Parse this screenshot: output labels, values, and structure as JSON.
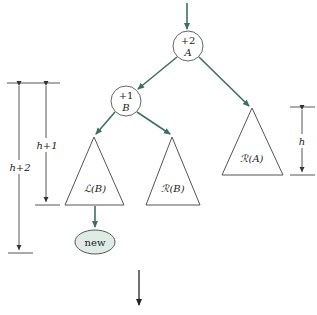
{
  "diagram": {
    "type": "avl-tree-rotation-case",
    "colors": {
      "edge": "#3f6e63",
      "new_node_fill": "#dfece6",
      "outline": "#555555"
    },
    "nodes": {
      "A": {
        "balance": "+2",
        "name": "A"
      },
      "B": {
        "balance": "+1",
        "name": "B"
      },
      "new": {
        "label": "new"
      }
    },
    "subtrees": {
      "LB": {
        "label": "ℒ(B)"
      },
      "RB": {
        "label": "ℛ(B)"
      },
      "RA": {
        "label": "ℛ(A)"
      }
    },
    "dimensions": {
      "left_outer": "h+2",
      "left_inner": "h+1",
      "right": "h"
    }
  }
}
